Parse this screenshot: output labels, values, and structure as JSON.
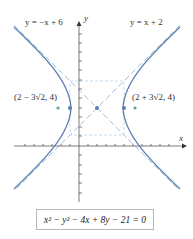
{
  "figure": {
    "asymptote_left_label": "y = −x + 6",
    "asymptote_right_label": "y = x + 2",
    "axis_x_label": "x",
    "axis_y_label": "y",
    "focus_left_label": "(2 − 3√2, 4)",
    "focus_right_label": "(2 + 3√2, 4)",
    "equation": "x² − y² − 4x + 8y − 21 = 0",
    "colors": {
      "hyperbola": "#5b7fb0",
      "asymptote": "#9fc3e0",
      "focus": "#5aa886",
      "vertex": "#5b7fb0",
      "axis": "#333333"
    }
  }
}
